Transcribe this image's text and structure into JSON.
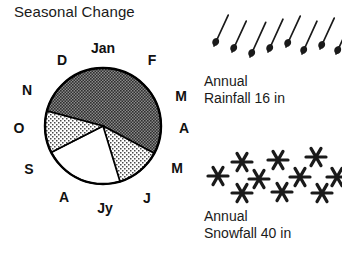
{
  "title": "Seasonal Change",
  "colors": {
    "ink": "#111111",
    "outline": "#000000",
    "dark_fill": "#6b6b6b",
    "medium_fill": "#c9c9c9",
    "light_fill": "#ffffff",
    "background": "#ffffff"
  },
  "pie": {
    "name": "seasonal-change-pie",
    "center": {
      "x": 103,
      "y": 102
    },
    "radius": 58,
    "month_labels": [
      {
        "key": "jan",
        "text": "Jan",
        "angle_deg": 0,
        "x": 103,
        "y": 24
      },
      {
        "key": "feb",
        "text": "F",
        "angle_deg": 30,
        "x": 152,
        "y": 36
      },
      {
        "key": "mar",
        "text": "M",
        "angle_deg": 60,
        "x": 181,
        "y": 72
      },
      {
        "key": "apr",
        "text": "A",
        "angle_deg": 90,
        "x": 184,
        "y": 104
      },
      {
        "key": "may",
        "text": "M",
        "angle_deg": 120,
        "x": 177,
        "y": 144
      },
      {
        "key": "jun",
        "text": "J",
        "angle_deg": 150,
        "x": 147,
        "y": 174
      },
      {
        "key": "jul",
        "text": "Jy",
        "angle_deg": 180,
        "x": 105,
        "y": 184
      },
      {
        "key": "aug",
        "text": "A",
        "angle_deg": 210,
        "x": 64,
        "y": 173
      },
      {
        "key": "sep",
        "text": "S",
        "angle_deg": 240,
        "x": 29,
        "y": 145
      },
      {
        "key": "oct",
        "text": "O",
        "angle_deg": 270,
        "x": 19,
        "y": 104
      },
      {
        "key": "nov",
        "text": "N",
        "angle_deg": 300,
        "x": 27,
        "y": 66
      },
      {
        "key": "dec",
        "text": "D",
        "angle_deg": 330,
        "x": 62,
        "y": 36
      }
    ]
  },
  "chart_data": {
    "type": "pie",
    "title": "Seasonal Change",
    "categories": [
      "Jan",
      "F",
      "M",
      "A",
      "M",
      "J",
      "Jy",
      "A",
      "S",
      "O",
      "N",
      "D"
    ],
    "legend_position": "none",
    "grid": false,
    "series": [
      {
        "name": "seasonal-shading",
        "slices": [
          {
            "label": "dark-season",
            "start_deg": 285,
            "end_deg": 118,
            "sweep_deg": 193,
            "fill": "#6b6b6b",
            "pattern": "dark-stipple"
          },
          {
            "label": "medium-season-late-spring",
            "start_deg": 118,
            "end_deg": 163,
            "sweep_deg": 45,
            "fill": "#c9c9c9",
            "pattern": "light-stipple"
          },
          {
            "label": "light-season-summer",
            "start_deg": 163,
            "end_deg": 243,
            "sweep_deg": 80,
            "fill": "#ffffff",
            "pattern": "none"
          },
          {
            "label": "medium-season-autumn",
            "start_deg": 243,
            "end_deg": 285,
            "sweep_deg": 42,
            "fill": "#c9c9c9",
            "pattern": "light-stipple"
          }
        ]
      }
    ]
  },
  "rainfall": {
    "icon_name": "raindrop-icon",
    "icon_count": 8,
    "caption": "Annual\nRainfall 16 in",
    "amount": 16,
    "unit": "in",
    "drops": [
      {
        "x": 18,
        "y": 44,
        "len": 34,
        "tilt_deg": 22
      },
      {
        "x": 36,
        "y": 50,
        "len": 34,
        "tilt_deg": 22
      },
      {
        "x": 54,
        "y": 55,
        "len": 38,
        "tilt_deg": 22
      },
      {
        "x": 72,
        "y": 50,
        "len": 36,
        "tilt_deg": 22
      },
      {
        "x": 90,
        "y": 45,
        "len": 34,
        "tilt_deg": 22
      },
      {
        "x": 106,
        "y": 52,
        "len": 36,
        "tilt_deg": 22
      },
      {
        "x": 124,
        "y": 47,
        "len": 34,
        "tilt_deg": 22
      },
      {
        "x": 140,
        "y": 52,
        "len": 34,
        "tilt_deg": 22
      }
    ]
  },
  "snowfall": {
    "icon_name": "snowflake-icon",
    "icon_count": 13,
    "caption": "Annual\nSnowfall 40 in",
    "amount": 40,
    "unit": "in",
    "flakes": [
      {
        "x": 22,
        "y": 40,
        "r": 10
      },
      {
        "x": 46,
        "y": 26,
        "r": 10
      },
      {
        "x": 63,
        "y": 43,
        "r": 10
      },
      {
        "x": 46,
        "y": 57,
        "r": 10
      },
      {
        "x": 82,
        "y": 24,
        "r": 10
      },
      {
        "x": 86,
        "y": 56,
        "r": 10
      },
      {
        "x": 104,
        "y": 41,
        "r": 10
      },
      {
        "x": 120,
        "y": 21,
        "r": 10
      },
      {
        "x": 126,
        "y": 57,
        "r": 10
      },
      {
        "x": 141,
        "y": 41,
        "r": 10
      }
    ]
  }
}
